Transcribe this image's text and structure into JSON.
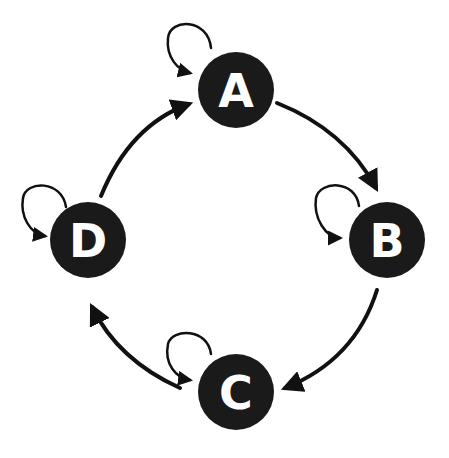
{
  "diagram": {
    "type": "state-transition-cycle",
    "colors": {
      "background": "#ffffff",
      "node_fill": "#1a1a1a",
      "node_label": "#ffffff",
      "edge": "#111111"
    },
    "nodes": [
      {
        "id": "A",
        "label": "A",
        "cx": 236,
        "cy": 90,
        "r": 38
      },
      {
        "id": "B",
        "label": "B",
        "cx": 387,
        "cy": 240,
        "r": 38
      },
      {
        "id": "C",
        "label": "C",
        "cx": 236,
        "cy": 392,
        "r": 38
      },
      {
        "id": "D",
        "label": "D",
        "cx": 88,
        "cy": 240,
        "r": 38
      }
    ],
    "edges": [
      {
        "from": "A",
        "to": "B"
      },
      {
        "from": "B",
        "to": "C"
      },
      {
        "from": "C",
        "to": "D"
      },
      {
        "from": "D",
        "to": "A"
      },
      {
        "from": "A",
        "to": "A",
        "self_loop": true
      },
      {
        "from": "B",
        "to": "B",
        "self_loop": true
      },
      {
        "from": "C",
        "to": "C",
        "self_loop": true
      },
      {
        "from": "D",
        "to": "D",
        "self_loop": true
      }
    ]
  }
}
